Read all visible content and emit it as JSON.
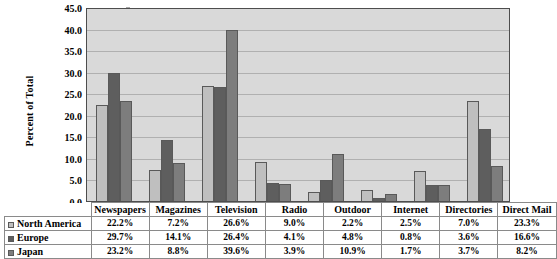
{
  "chart_data": {
    "type": "bar",
    "title": "",
    "subtitle": "",
    "xlabel": "",
    "ylabel": "Percent of Total",
    "ylim": [
      0,
      45
    ],
    "ytick_step": 5,
    "ytick_labels": [
      "0.0",
      "5.0",
      "10.0",
      "15.0",
      "20.0",
      "25.0",
      "30.0",
      "35.0",
      "40.0",
      "45.0"
    ],
    "grid": true,
    "legend_position": "table-row-headers",
    "categories": [
      "Newspapers",
      "Magazines",
      "Television",
      "Radio",
      "Outdoor",
      "Internet",
      "Directories",
      "Direct Mail"
    ],
    "series": [
      {
        "name": "North America",
        "color": "#bfbfbf",
        "values": [
          22.2,
          7.2,
          26.6,
          9.0,
          2.2,
          2.5,
          7.0,
          23.3
        ],
        "labels": [
          "22.2%",
          "7.2%",
          "26.6%",
          "9.0%",
          "2.2%",
          "2.5%",
          "7.0%",
          "23.3%"
        ]
      },
      {
        "name": "Europe",
        "color": "#5e5e5e",
        "values": [
          29.7,
          14.1,
          26.4,
          4.1,
          4.8,
          0.8,
          3.6,
          16.6
        ],
        "labels": [
          "29.7%",
          "14.1%",
          "26.4%",
          "4.1%",
          "4.8%",
          "0.8%",
          "3.6%",
          "16.6%"
        ]
      },
      {
        "name": "Japan",
        "color": "#7d7d7d",
        "values": [
          23.2,
          8.8,
          39.6,
          3.9,
          10.9,
          1.7,
          3.7,
          8.2
        ],
        "labels": [
          "23.2%",
          "8.8%",
          "39.6%",
          "3.9%",
          "10.9%",
          "1.7%",
          "3.7%",
          "8.2%"
        ]
      }
    ],
    "plot_background": "#d9d9d9",
    "gridline_color": "#b0b0b0",
    "axis_color": "#4d4d4d"
  }
}
